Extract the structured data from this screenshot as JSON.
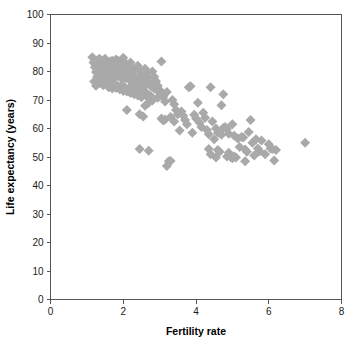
{
  "chart_data": {
    "type": "scatter",
    "title": "",
    "xlabel": "Fertility rate",
    "ylabel": "Life expectancy (years)",
    "xlim": [
      0,
      8
    ],
    "ylim": [
      0,
      100
    ],
    "xticks": [
      0,
      2,
      4,
      6,
      8
    ],
    "yticks": [
      0,
      10,
      20,
      30,
      40,
      50,
      60,
      70,
      80,
      90,
      100
    ],
    "grid": false,
    "legend": null,
    "marker": {
      "shape": "diamond",
      "color": "#a9a9a9",
      "size": 5
    },
    "series": [
      {
        "name": "Countries",
        "points": [
          [
            1.15,
            85.0
          ],
          [
            1.18,
            83.2
          ],
          [
            1.22,
            81.5
          ],
          [
            1.25,
            79.8
          ],
          [
            1.28,
            78.2
          ],
          [
            1.3,
            84.0
          ],
          [
            1.32,
            82.5
          ],
          [
            1.34,
            80.5
          ],
          [
            1.36,
            79.0
          ],
          [
            1.38,
            77.5
          ],
          [
            1.4,
            83.5
          ],
          [
            1.42,
            82.0
          ],
          [
            1.44,
            80.8
          ],
          [
            1.46,
            79.5
          ],
          [
            1.48,
            78.0
          ],
          [
            1.5,
            84.5
          ],
          [
            1.52,
            83.0
          ],
          [
            1.54,
            81.8
          ],
          [
            1.56,
            80.2
          ],
          [
            1.58,
            78.8
          ],
          [
            1.6,
            82.8
          ],
          [
            1.62,
            81.2
          ],
          [
            1.64,
            80.0
          ],
          [
            1.66,
            78.5
          ],
          [
            1.68,
            77.0
          ],
          [
            1.7,
            83.8
          ],
          [
            1.72,
            82.2
          ],
          [
            1.74,
            81.0
          ],
          [
            1.76,
            79.2
          ],
          [
            1.78,
            77.8
          ],
          [
            1.8,
            84.2
          ],
          [
            1.82,
            82.6
          ],
          [
            1.84,
            81.4
          ],
          [
            1.86,
            80.0
          ],
          [
            1.88,
            78.4
          ],
          [
            1.9,
            83.0
          ],
          [
            1.92,
            81.6
          ],
          [
            1.94,
            80.4
          ],
          [
            1.96,
            79.0
          ],
          [
            1.98,
            77.2
          ],
          [
            2.0,
            84.8
          ],
          [
            2.02,
            83.4
          ],
          [
            2.04,
            82.0
          ],
          [
            2.06,
            80.6
          ],
          [
            2.08,
            79.4
          ],
          [
            2.1,
            82.4
          ],
          [
            2.12,
            81.0
          ],
          [
            2.14,
            79.6
          ],
          [
            2.16,
            78.2
          ],
          [
            2.18,
            76.8
          ],
          [
            2.2,
            83.2
          ],
          [
            2.24,
            81.2
          ],
          [
            2.28,
            79.8
          ],
          [
            2.32,
            78.0
          ],
          [
            2.36,
            76.5
          ],
          [
            2.4,
            82.0
          ],
          [
            2.44,
            80.5
          ],
          [
            2.48,
            78.6
          ],
          [
            2.52,
            77.0
          ],
          [
            2.56,
            75.5
          ],
          [
            2.6,
            81.0
          ],
          [
            2.64,
            79.4
          ],
          [
            2.68,
            77.8
          ],
          [
            2.72,
            76.2
          ],
          [
            2.76,
            74.8
          ],
          [
            2.8,
            80.0
          ],
          [
            2.85,
            78.2
          ],
          [
            2.9,
            76.6
          ],
          [
            2.95,
            75.0
          ],
          [
            3.0,
            73.5
          ],
          [
            1.2,
            76.5
          ],
          [
            1.25,
            75.0
          ],
          [
            1.35,
            76.0
          ],
          [
            1.45,
            75.2
          ],
          [
            1.55,
            76.2
          ],
          [
            1.6,
            74.5
          ],
          [
            1.65,
            75.8
          ],
          [
            1.7,
            74.0
          ],
          [
            1.75,
            75.5
          ],
          [
            1.8,
            74.2
          ],
          [
            1.85,
            75.0
          ],
          [
            1.9,
            73.8
          ],
          [
            1.95,
            74.8
          ],
          [
            2.0,
            73.2
          ],
          [
            2.05,
            74.4
          ],
          [
            2.1,
            73.0
          ],
          [
            2.15,
            74.0
          ],
          [
            2.2,
            72.5
          ],
          [
            2.25,
            73.6
          ],
          [
            2.3,
            72.0
          ],
          [
            2.35,
            73.0
          ],
          [
            2.4,
            71.6
          ],
          [
            2.45,
            72.8
          ],
          [
            2.5,
            71.0
          ],
          [
            2.55,
            72.2
          ],
          [
            1.4,
            78.0
          ],
          [
            1.5,
            77.2
          ],
          [
            1.6,
            79.0
          ],
          [
            1.9,
            80.8
          ],
          [
            2.05,
            77.6
          ],
          [
            2.15,
            78.6
          ],
          [
            2.25,
            77.0
          ],
          [
            2.35,
            75.8
          ],
          [
            2.45,
            76.8
          ],
          [
            2.55,
            74.5
          ],
          [
            2.6,
            73.0
          ],
          [
            2.65,
            72.0
          ],
          [
            2.7,
            70.5
          ],
          [
            2.75,
            71.5
          ],
          [
            2.8,
            69.8
          ],
          [
            2.1,
            66.5
          ],
          [
            2.45,
            65.0
          ],
          [
            2.55,
            64.2
          ],
          [
            2.6,
            68.0
          ],
          [
            2.7,
            69.0
          ],
          [
            2.95,
            70.8
          ],
          [
            3.0,
            72.5
          ],
          [
            3.05,
            83.5
          ],
          [
            3.1,
            71.0
          ],
          [
            3.15,
            69.5
          ],
          [
            3.05,
            63.5
          ],
          [
            3.1,
            62.8
          ],
          [
            3.15,
            63.2
          ],
          [
            3.2,
            46.8
          ],
          [
            3.25,
            48.5
          ],
          [
            3.3,
            48.6
          ],
          [
            3.35,
            70.0
          ],
          [
            3.4,
            68.5
          ],
          [
            3.45,
            66.5
          ],
          [
            3.5,
            65.0
          ],
          [
            3.55,
            59.3
          ],
          [
            3.6,
            66.0
          ],
          [
            3.65,
            64.5
          ],
          [
            3.7,
            63.0
          ],
          [
            3.75,
            61.5
          ],
          [
            3.8,
            74.5
          ],
          [
            3.85,
            74.8
          ],
          [
            3.9,
            58.5
          ],
          [
            3.95,
            64.8
          ],
          [
            4.0,
            63.5
          ],
          [
            4.05,
            69.0
          ],
          [
            4.1,
            62.0
          ],
          [
            4.15,
            60.5
          ],
          [
            4.2,
            65.5
          ],
          [
            4.25,
            63.8
          ],
          [
            4.3,
            59.5
          ],
          [
            4.35,
            58.0
          ],
          [
            4.4,
            74.5
          ],
          [
            4.45,
            62.5
          ],
          [
            4.5,
            56.2
          ],
          [
            4.55,
            60.0
          ],
          [
            4.6,
            52.5
          ],
          [
            4.65,
            51.8
          ],
          [
            4.7,
            68.2
          ],
          [
            4.75,
            72.0
          ],
          [
            4.8,
            60.5
          ],
          [
            4.85,
            59.8
          ],
          [
            4.9,
            51.5
          ],
          [
            4.95,
            50.0
          ],
          [
            5.0,
            61.5
          ],
          [
            5.05,
            57.5
          ],
          [
            5.1,
            49.8
          ],
          [
            5.15,
            56.5
          ],
          [
            5.2,
            53.5
          ],
          [
            5.25,
            57.0
          ],
          [
            5.3,
            56.8
          ],
          [
            5.35,
            52.6
          ],
          [
            5.4,
            51.8
          ],
          [
            5.45,
            58.8
          ],
          [
            5.5,
            63.0
          ],
          [
            5.55,
            55.0
          ],
          [
            5.6,
            50.5
          ],
          [
            5.65,
            56.2
          ],
          [
            5.7,
            53.0
          ],
          [
            5.75,
            52.0
          ],
          [
            5.8,
            55.8
          ],
          [
            5.9,
            51.0
          ],
          [
            6.0,
            54.5
          ],
          [
            6.05,
            53.0
          ],
          [
            6.1,
            52.8
          ],
          [
            6.15,
            48.8
          ],
          [
            6.2,
            52.5
          ],
          [
            2.45,
            52.8
          ],
          [
            2.7,
            52.2
          ],
          [
            4.35,
            52.8
          ],
          [
            4.4,
            51.0
          ],
          [
            4.55,
            49.8
          ],
          [
            4.85,
            50.2
          ],
          [
            5.0,
            49.6
          ],
          [
            7.0,
            55.0
          ],
          [
            1.25,
            82.8
          ],
          [
            1.35,
            84.5
          ],
          [
            1.45,
            83.0
          ],
          [
            1.55,
            82.4
          ],
          [
            1.65,
            83.6
          ],
          [
            1.75,
            82.0
          ],
          [
            1.85,
            83.8
          ],
          [
            1.95,
            82.2
          ],
          [
            2.05,
            81.5
          ],
          [
            2.15,
            80.0
          ],
          [
            2.25,
            79.0
          ],
          [
            2.3,
            75.5
          ],
          [
            2.4,
            74.0
          ],
          [
            2.5,
            73.5
          ],
          [
            2.65,
            76.5
          ],
          [
            2.85,
            74.0
          ],
          [
            3.2,
            72.8
          ],
          [
            3.3,
            64.0
          ],
          [
            3.4,
            62.5
          ],
          [
            4.6,
            58.5
          ],
          [
            4.7,
            57.8
          ],
          [
            4.75,
            60.2
          ],
          [
            4.9,
            58.2
          ],
          [
            5.05,
            50.2
          ],
          [
            5.35,
            48.5
          ]
        ]
      }
    ]
  },
  "axes": {
    "y_tick_labels": [
      "0",
      "10",
      "20",
      "30",
      "40",
      "50",
      "60",
      "70",
      "80",
      "90",
      "100"
    ],
    "x_tick_labels": [
      "0",
      "2",
      "4",
      "6",
      "8"
    ],
    "x_title": "Fertility rate",
    "y_title": "Life expectancy (years)"
  },
  "colors": {
    "marker": "#a9a9a9",
    "axis": "#555555",
    "text": "#1a1a1a",
    "background": "#ffffff"
  }
}
